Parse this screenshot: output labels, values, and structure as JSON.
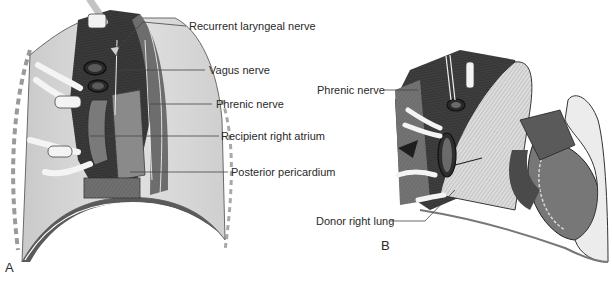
{
  "figure": {
    "panel_a": {
      "letter": "A",
      "labels": [
        {
          "id": "recurrent-laryngeal-nerve",
          "text": "Recurrent laryngeal nerve"
        },
        {
          "id": "vagus-nerve",
          "text": "Vagus nerve"
        },
        {
          "id": "phrenic-nerve",
          "text": "Phrenic nerve"
        },
        {
          "id": "recipient-right-atrium",
          "text": "Recipient right atrium"
        },
        {
          "id": "posterior-pericardium",
          "text": "Posterior pericardium"
        }
      ]
    },
    "panel_b": {
      "letter": "B",
      "labels": [
        {
          "id": "phrenic-nerve",
          "text": "Phrenic nerve"
        },
        {
          "id": "donor-right-lung",
          "text": "Donor right lung"
        }
      ]
    },
    "colors": {
      "background": "#ffffff",
      "tissue_dark": "#3a3a3a",
      "tissue_mid": "#7a7a7a",
      "tissue_light": "#d0d0d0",
      "leader_line": "#444444",
      "text": "#2a2a2a"
    }
  }
}
